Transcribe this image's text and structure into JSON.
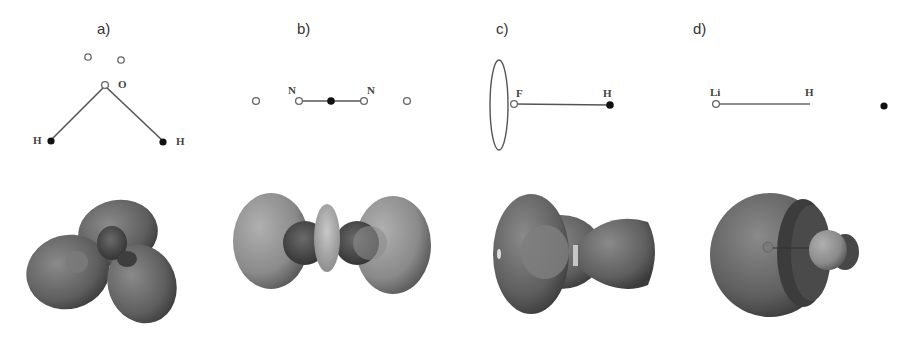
{
  "figure": {
    "panels": [
      {
        "id": "a",
        "label": "a)",
        "molecule": "H2O",
        "atoms": [
          {
            "symbol": "O",
            "label": "O",
            "type": "open"
          },
          {
            "symbol": "H",
            "label": "H",
            "type": "filled"
          },
          {
            "symbol": "H",
            "label": "H",
            "type": "filled"
          }
        ],
        "extra_points": [
          {
            "type": "open"
          },
          {
            "type": "open"
          }
        ],
        "orbital_render": "four-lobed isosurface (three large lobes around central node)"
      },
      {
        "id": "b",
        "label": "b)",
        "molecule": "N2",
        "atoms": [
          {
            "symbol": "N",
            "label": "N",
            "type": "open"
          },
          {
            "symbol": "N",
            "label": "N",
            "type": "open"
          }
        ],
        "extra_points": [
          {
            "type": "open"
          },
          {
            "type": "filled"
          },
          {
            "type": "open"
          }
        ],
        "orbital_render": "two large end lobes with central torus ring"
      },
      {
        "id": "c",
        "label": "c)",
        "molecule": "HF",
        "atoms": [
          {
            "symbol": "F",
            "label": "F",
            "type": "open"
          },
          {
            "symbol": "H",
            "label": "H",
            "type": "filled"
          }
        ],
        "ring": {
          "type": "ellipse"
        },
        "orbital_render": "large ovoid lobe at F plus smaller lobe toward H"
      },
      {
        "id": "d",
        "label": "d)",
        "molecule": "LiH",
        "atoms": [
          {
            "symbol": "Li",
            "label": "Li",
            "type": "open"
          },
          {
            "symbol": "H",
            "label": "H",
            "type": "none"
          }
        ],
        "extra_points": [
          {
            "type": "filled"
          }
        ],
        "orbital_render": "large cup-shaped shell around Li with small bulb toward H"
      }
    ],
    "colors": {
      "background": "#ffffff",
      "lines": "#555555",
      "filled_atom": "#111111",
      "open_atom_stroke": "#666666",
      "lobe_dark": "#3a3a3a",
      "lobe_mid": "#6e6e6e",
      "lobe_light": "#a8a8a8",
      "ring_light": "#b5b5b5"
    }
  }
}
